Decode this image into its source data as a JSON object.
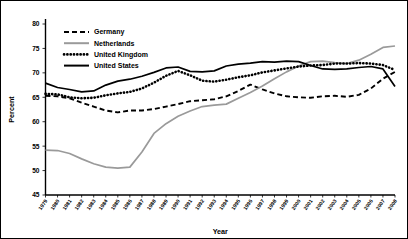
{
  "chart_data": {
    "type": "line",
    "title": "",
    "xlabel": "Year",
    "ylabel": "Percent",
    "ylim": [
      45,
      80
    ],
    "yticks": [
      45,
      50,
      55,
      60,
      65,
      70,
      75,
      80
    ],
    "grid": false,
    "legend_position": "top-left",
    "x": [
      1979,
      1980,
      1981,
      1982,
      1983,
      1984,
      1985,
      1986,
      1987,
      1988,
      1989,
      1990,
      1991,
      1992,
      1993,
      1994,
      1995,
      1996,
      1997,
      1998,
      1999,
      2000,
      2001,
      2002,
      2003,
      2004,
      2005,
      2006,
      2007,
      2008
    ],
    "categories": [
      "1979",
      "1980",
      "1981",
      "1982",
      "1983",
      "1984",
      "1985",
      "1986",
      "1987",
      "1988",
      "1989",
      "1990",
      "1991",
      "1992",
      "1993",
      "1994",
      "1995",
      "1996",
      "1997",
      "1998",
      "1999",
      "2000",
      "2001",
      "2002",
      "2003",
      "2004",
      "2005",
      "2006",
      "2007",
      "2008"
    ],
    "series": [
      {
        "name": "Germany",
        "style": "dashed",
        "color": "#000000",
        "values": [
          65.3,
          65.2,
          64.8,
          63.9,
          63.1,
          62.3,
          61.9,
          62.3,
          62.3,
          62.6,
          63.1,
          63.6,
          64.2,
          64.4,
          64.6,
          65.2,
          66.3,
          67.6,
          66.6,
          65.8,
          65.2,
          65.0,
          64.9,
          65.2,
          65.3,
          65.1,
          65.5,
          66.8,
          68.8,
          70.2
        ]
      },
      {
        "name": "Netherlands",
        "style": "solid",
        "color": "#9a9a9a",
        "values": [
          54.2,
          54.1,
          53.5,
          52.4,
          51.4,
          50.7,
          50.5,
          50.7,
          53.8,
          57.6,
          59.6,
          61.1,
          62.2,
          63.1,
          63.4,
          63.6,
          64.8,
          66.0,
          67.3,
          68.8,
          70.2,
          71.4,
          72.3,
          72.4,
          72.1,
          71.9,
          72.6,
          73.8,
          75.2,
          75.5
        ]
      },
      {
        "name": "United Kingdom",
        "style": "dotted",
        "color": "#000000",
        "values": [
          65.7,
          65.6,
          65.0,
          64.8,
          64.9,
          65.4,
          65.8,
          66.1,
          66.8,
          68.0,
          69.4,
          70.4,
          69.5,
          68.4,
          68.2,
          68.6,
          69.1,
          69.5,
          70.1,
          70.5,
          70.9,
          71.3,
          71.5,
          71.6,
          71.9,
          71.9,
          72.0,
          71.9,
          71.6,
          70.6
        ]
      },
      {
        "name": "United States",
        "style": "solid",
        "color": "#000000",
        "values": [
          67.9,
          67.0,
          66.6,
          66.1,
          66.3,
          67.5,
          68.3,
          68.7,
          69.3,
          70.1,
          71.0,
          71.2,
          70.3,
          70.2,
          70.4,
          71.4,
          71.8,
          72.0,
          72.3,
          72.2,
          72.4,
          72.3,
          71.5,
          70.8,
          70.7,
          70.8,
          71.1,
          71.3,
          70.8,
          67.2
        ]
      }
    ]
  },
  "legend": {
    "items": [
      {
        "label": "Germany"
      },
      {
        "label": "Netherlands"
      },
      {
        "label": "United Kingdom"
      },
      {
        "label": "United States"
      }
    ]
  },
  "axes": {
    "y_title": "Percent",
    "x_title": "Year"
  }
}
